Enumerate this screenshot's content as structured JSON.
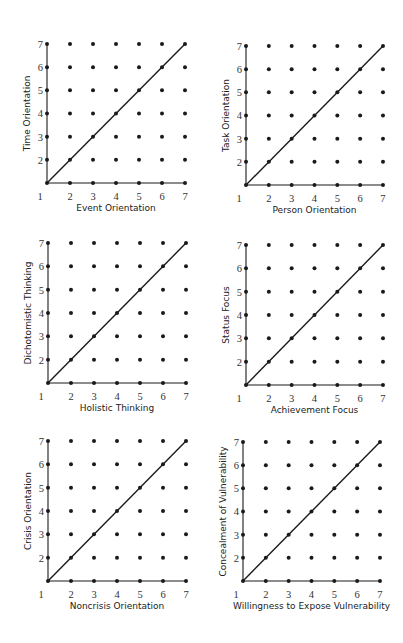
{
  "colors": {
    "background": "#ffffff",
    "ink": "#1a1a1a",
    "tick_text": "#333333"
  },
  "chart_data": [
    {
      "type": "scatter",
      "title": "",
      "xlabel": "Event Orientation",
      "ylabel": "Time Orientation",
      "x_ticks": [
        1,
        2,
        3,
        4,
        5,
        6,
        7
      ],
      "y_ticks": [
        2,
        3,
        4,
        5,
        6,
        7
      ],
      "xlim": [
        1,
        7
      ],
      "ylim": [
        1,
        7
      ],
      "grid": "7x7 dot lattice at integer points",
      "diagonal_line": {
        "from": [
          1,
          1
        ],
        "to": [
          7,
          7
        ]
      },
      "geometry": {
        "ox": 47,
        "oy": 183,
        "dx": 23.0,
        "dy": 23.17
      }
    },
    {
      "type": "scatter",
      "title": "",
      "xlabel": "Person Orientation",
      "ylabel": "Task Orientation",
      "x_ticks": [
        1,
        2,
        3,
        4,
        5,
        6,
        7
      ],
      "y_ticks": [
        2,
        3,
        4,
        5,
        6,
        7
      ],
      "xlim": [
        1,
        7
      ],
      "ylim": [
        1,
        7
      ],
      "grid": "7x7 dot lattice at integer points",
      "diagonal_line": {
        "from": [
          1,
          1
        ],
        "to": [
          7,
          7
        ]
      },
      "geometry": {
        "ox": 246,
        "oy": 185,
        "dx": 22.83,
        "dy": 23.17
      }
    },
    {
      "type": "scatter",
      "title": "",
      "xlabel": "Holistic Thinking",
      "ylabel": "Dichotomistic Thinking",
      "x_ticks": [
        1,
        2,
        3,
        4,
        5,
        6,
        7
      ],
      "y_ticks": [
        2,
        3,
        4,
        5,
        6,
        7
      ],
      "xlim": [
        1,
        7
      ],
      "ylim": [
        1,
        7
      ],
      "grid": "7x7 dot lattice at integer points",
      "diagonal_line": {
        "from": [
          1,
          1
        ],
        "to": [
          7,
          7
        ]
      },
      "geometry": {
        "ox": 48,
        "oy": 383,
        "dx": 23.0,
        "dy": 23.33
      }
    },
    {
      "type": "scatter",
      "title": "",
      "xlabel": "Achievement Focus",
      "ylabel": "Status Focus",
      "x_ticks": [
        1,
        2,
        3,
        4,
        5,
        6,
        7
      ],
      "y_ticks": [
        2,
        3,
        4,
        5,
        6,
        7
      ],
      "xlim": [
        1,
        7
      ],
      "ylim": [
        1,
        7
      ],
      "grid": "7x7 dot lattice at integer points",
      "diagonal_line": {
        "from": [
          1,
          1
        ],
        "to": [
          7,
          7
        ]
      },
      "geometry": {
        "ox": 246,
        "oy": 385,
        "dx": 22.83,
        "dy": 23.33
      }
    },
    {
      "type": "scatter",
      "title": "",
      "xlabel": "Noncrisis Orientation",
      "ylabel": "Crisis Orientation",
      "x_ticks": [
        1,
        2,
        3,
        4,
        5,
        6,
        7
      ],
      "y_ticks": [
        2,
        3,
        4,
        5,
        6,
        7
      ],
      "xlim": [
        1,
        7
      ],
      "ylim": [
        1,
        7
      ],
      "grid": "7x7 dot lattice at integer points",
      "diagonal_line": {
        "from": [
          1,
          1
        ],
        "to": [
          7,
          7
        ]
      },
      "geometry": {
        "ox": 48,
        "oy": 581,
        "dx": 23.0,
        "dy": 23.33
      }
    },
    {
      "type": "scatter",
      "title": "",
      "xlabel": "Willingness to Expose Vulnerability",
      "ylabel": "Concealment of Vulnerability",
      "x_ticks": [
        1,
        2,
        3,
        4,
        5,
        6,
        7
      ],
      "y_ticks": [
        2,
        3,
        4,
        5,
        6,
        7
      ],
      "xlim": [
        1,
        7
      ],
      "ylim": [
        1,
        7
      ],
      "grid": "7x7 dot lattice at integer points",
      "diagonal_line": {
        "from": [
          1,
          1
        ],
        "to": [
          7,
          7
        ]
      },
      "geometry": {
        "ox": 243,
        "oy": 581,
        "dx": 22.83,
        "dy": 23.17
      }
    }
  ]
}
